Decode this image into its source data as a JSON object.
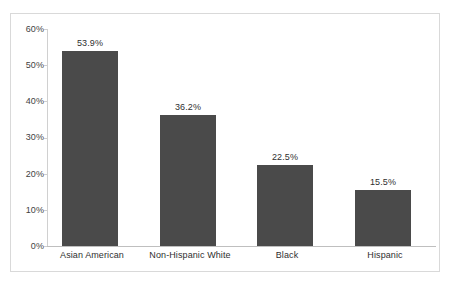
{
  "chart_data": {
    "type": "bar",
    "title": "",
    "xlabel": "",
    "ylabel": "",
    "categories": [
      "Asian American",
      "Non-Hispanic White",
      "Black",
      "Hispanic"
    ],
    "values": [
      53.9,
      36.2,
      22.5,
      15.5
    ],
    "value_labels": [
      "53.9%",
      "36.2%",
      "22.5%",
      "15.5%"
    ],
    "ylim": [
      0,
      60
    ],
    "ytick_values": [
      0,
      10,
      20,
      30,
      40,
      50,
      60
    ],
    "ytick_labels": [
      "0%",
      "10%",
      "20%",
      "30%",
      "40%",
      "50%",
      "60%"
    ],
    "grid": false,
    "legend": null,
    "legend_position": "none",
    "series": [
      {
        "name": "",
        "values": [
          53.9,
          36.2,
          22.5,
          15.5
        ]
      }
    ],
    "colors": {
      "bar": "#4a4a4a",
      "axis": "#cfcfcf",
      "frame": "#d9d9d9",
      "text": "#2f2f2f",
      "background": "#ffffff"
    }
  }
}
